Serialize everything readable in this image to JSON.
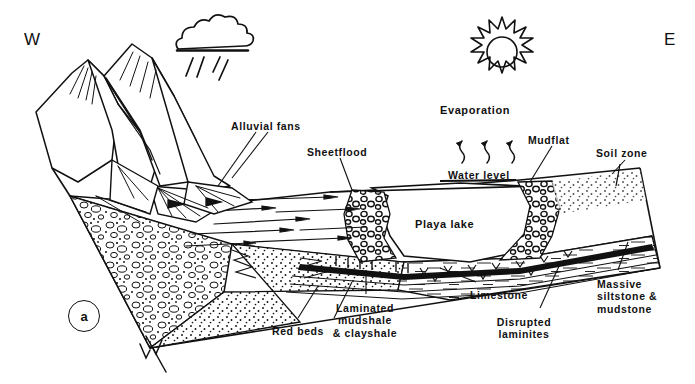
{
  "figure": {
    "panel_label": "a",
    "background_color": "#ffffff",
    "ink_color": "#111111",
    "width": 695,
    "height": 384
  },
  "compass": {
    "west": "W",
    "east": "E"
  },
  "icons": {
    "cloud": "rain-cloud-icon",
    "sun": "sun-icon",
    "rain": "rain-streaks-icon",
    "evaporation_arrows": "evaporation-arrows-icon",
    "fault": "fault-symbol-icon",
    "flow_arrows": "flow-arrow-icon"
  },
  "labels": [
    {
      "id": "alluvial-fans",
      "text": "Alluvial fans",
      "x": 231,
      "y": 120,
      "size": "sm",
      "align": "left"
    },
    {
      "id": "sheetflood",
      "text": "Sheetflood",
      "x": 307,
      "y": 146,
      "size": "sm",
      "align": "left"
    },
    {
      "id": "evaporation",
      "text": "Evaporation",
      "x": 440,
      "y": 104,
      "size": "md",
      "align": "left"
    },
    {
      "id": "water-level",
      "text": "Water level",
      "x": 448,
      "y": 169,
      "size": "sm",
      "align": "left"
    },
    {
      "id": "mudflat",
      "text": "Mudflat",
      "x": 528,
      "y": 134,
      "size": "sm",
      "align": "left"
    },
    {
      "id": "soil-zone",
      "text": "Soil zone",
      "x": 596,
      "y": 147,
      "size": "sm",
      "align": "left"
    },
    {
      "id": "playa-lake",
      "text": "Playa lake",
      "x": 415,
      "y": 218,
      "size": "md",
      "align": "left"
    },
    {
      "id": "red-beds",
      "text": "Red beds",
      "x": 272,
      "y": 325,
      "size": "sm",
      "align": "left"
    },
    {
      "id": "laminated-mudshale",
      "text": "Laminated\nmudshale\n& clayshale",
      "x": 365,
      "y": 302,
      "size": "sm",
      "align": "center"
    },
    {
      "id": "limestone",
      "text": "Limestone",
      "x": 470,
      "y": 289,
      "size": "sm",
      "align": "left"
    },
    {
      "id": "disrupted-laminites",
      "text": "Disrupted\nlaminites",
      "x": 524,
      "y": 316,
      "size": "sm",
      "align": "center"
    },
    {
      "id": "massive-siltstone",
      "text": "Massive\nsiltstone &\nmudstone",
      "x": 597,
      "y": 278,
      "size": "sm",
      "align": "left"
    }
  ],
  "facies": [
    {
      "id": "conglomerate",
      "name": "Conglomerate / alluvial fan gravel",
      "pattern": "pebbles"
    },
    {
      "id": "sandstone",
      "name": "Sheetflood sandstone",
      "pattern": "stipple"
    },
    {
      "id": "siltstone-mudstone",
      "name": "Massive siltstone & mudstone",
      "pattern": "dashes"
    },
    {
      "id": "mudshale",
      "name": "Laminated mudshale & clayshale",
      "pattern": "laminae"
    },
    {
      "id": "limestone-bed",
      "name": "Limestone",
      "pattern": "solid-band"
    },
    {
      "id": "nodular-carbonate",
      "name": "Nodular shoreline carbonate",
      "pattern": "nodules"
    }
  ]
}
